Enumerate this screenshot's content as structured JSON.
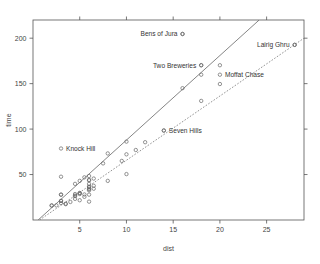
{
  "chart_data": {
    "type": "scatter",
    "title": "",
    "xlabel": "dist",
    "ylabel": "time",
    "xlim": [
      0,
      29
    ],
    "ylim": [
      0,
      220
    ],
    "xticks": [
      5,
      10,
      15,
      20,
      25
    ],
    "yticks": [
      50,
      100,
      150,
      200
    ],
    "grid": false,
    "legend": "none",
    "box": "full",
    "points": [
      {
        "x": 2.5,
        "y": 16.083
      },
      {
        "x": 6.0,
        "y": 48.35
      },
      {
        "x": 6.0,
        "y": 33.65
      },
      {
        "x": 6.5,
        "y": 45.6
      },
      {
        "x": 7.5,
        "y": 62.267
      },
      {
        "x": 8.0,
        "y": 73.217
      },
      {
        "x": 8.0,
        "y": 43.05
      },
      {
        "x": 16.0,
        "y": 204.617
      },
      {
        "x": 6.0,
        "y": 36.367
      },
      {
        "x": 5.0,
        "y": 29.75
      },
      {
        "x": 6.0,
        "y": 39.75
      },
      {
        "x": 28.0,
        "y": 192.667
      },
      {
        "x": 5.0,
        "y": 43.05
      },
      {
        "x": 9.5,
        "y": 65.0
      },
      {
        "x": 6.0,
        "y": 44.133
      },
      {
        "x": 4.5,
        "y": 26.933
      },
      {
        "x": 10.0,
        "y": 72.25
      },
      {
        "x": 6.0,
        "y": 36.567
      },
      {
        "x": 18.0,
        "y": 159.833
      },
      {
        "x": 4.5,
        "y": 39.75
      },
      {
        "x": 20.0,
        "y": 170.25
      },
      {
        "x": 5.5,
        "y": 28.1
      },
      {
        "x": 3.0,
        "y": 47.633
      },
      {
        "x": 3.5,
        "y": 17.933
      },
      {
        "x": 6.0,
        "y": 27.9
      },
      {
        "x": 2.0,
        "y": 15.95
      },
      {
        "x": 3.0,
        "y": 27.9
      },
      {
        "x": 4.0,
        "y": 19.833
      },
      {
        "x": 6.0,
        "y": 43.633
      },
      {
        "x": 5.0,
        "y": 21.75
      },
      {
        "x": 6.5,
        "y": 37.667
      },
      {
        "x": 5.0,
        "y": 29.567
      },
      {
        "x": 10.0,
        "y": 86.217
      },
      {
        "x": 6.0,
        "y": 34.433
      },
      {
        "x": 18.0,
        "y": 170.25
      },
      {
        "x": 4.5,
        "y": 28.567
      },
      {
        "x": 3.0,
        "y": 20.95
      },
      {
        "x": 5.5,
        "y": 46.933
      },
      {
        "x": 12.0,
        "y": 85.583
      },
      {
        "x": 16.0,
        "y": 145.0
      },
      {
        "x": 14.0,
        "y": 98.417
      },
      {
        "x": 3.0,
        "y": 21.0
      },
      {
        "x": 4.5,
        "y": 26.217
      },
      {
        "x": 6.5,
        "y": 34.433
      },
      {
        "x": 5.0,
        "y": 28.567
      },
      {
        "x": 10.0,
        "y": 50.5
      },
      {
        "x": 6.0,
        "y": 20.2
      },
      {
        "x": 18.0,
        "y": 131.0
      },
      {
        "x": 4.5,
        "y": 23.25
      },
      {
        "x": 20.0,
        "y": 149.575
      },
      {
        "x": 5.5,
        "y": 25.5
      },
      {
        "x": 11.0,
        "y": 77.0
      },
      {
        "x": 3.0,
        "y": 18.65
      },
      {
        "x": 3.5,
        "y": 17.417
      },
      {
        "x": 6.0,
        "y": 32.567
      },
      {
        "x": 2.0,
        "y": 15.95
      },
      {
        "x": 3.0,
        "y": 27.9
      }
    ],
    "labeled_points": [
      {
        "label": "Bens of Jura",
        "x": 16.0,
        "y": 204.617,
        "label_side": "left"
      },
      {
        "label": "Two Breweries",
        "x": 18.0,
        "y": 170.25,
        "label_side": "left"
      },
      {
        "label": "Lairig Ghru",
        "x": 28.0,
        "y": 192.667,
        "label_side": "left"
      },
      {
        "label": "Moffat Chase",
        "x": 20.0,
        "y": 159.833,
        "label_side": "right"
      },
      {
        "label": "Seven Hills",
        "x": 14.0,
        "y": 98.417,
        "label_side": "right"
      },
      {
        "label": "Knock Hill",
        "x": 3.0,
        "y": 78.65,
        "label_side": "right"
      }
    ],
    "fit_lines": [
      {
        "name": "least-squares-fit",
        "style": "solid",
        "x1": 0.55,
        "y1": 0.0,
        "x2": 24.2,
        "y2": 220.0
      },
      {
        "name": "resistant-fit",
        "style": "dashed",
        "x1": 0.7,
        "y1": 0.0,
        "x2": 29.0,
        "y2": 200.0
      }
    ]
  }
}
